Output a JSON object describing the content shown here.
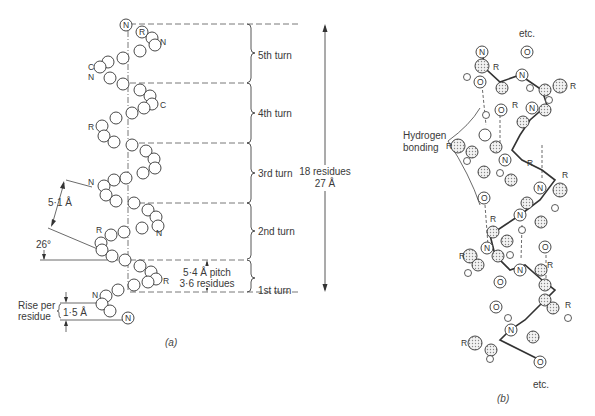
{
  "figure_a": {
    "caption": "(a)",
    "turns": [
      {
        "label": "5th turn"
      },
      {
        "label": "4th turn"
      },
      {
        "label": "3rd turn"
      },
      {
        "label": "2nd turn"
      },
      {
        "label": "1st turn"
      }
    ],
    "total_span": {
      "line1": "18 residues",
      "line2": "27 Å"
    },
    "pitch": {
      "line1": "5·4 Å pitch",
      "line2": "3·6 residues"
    },
    "rise": {
      "label_line1": "Rise per",
      "label_line2": "residue",
      "value": "1·5 Å"
    },
    "distance": "5·1 Å",
    "angle": "26°",
    "atom_labels": {
      "N": "N",
      "C": "C",
      "R": "R"
    }
  },
  "figure_b": {
    "caption": "(b)",
    "hydrogen_label_line1": "Hydrogen",
    "hydrogen_label_line2": "bonding",
    "etc_top": "etc.",
    "etc_bottom": "etc.",
    "atom_labels": {
      "N": "N",
      "O": "O",
      "R": "R"
    }
  },
  "colors": {
    "ink": "#3a3a3a",
    "dashed": "#555555",
    "stipple": "#cfcfcf",
    "background": "#ffffff"
  }
}
